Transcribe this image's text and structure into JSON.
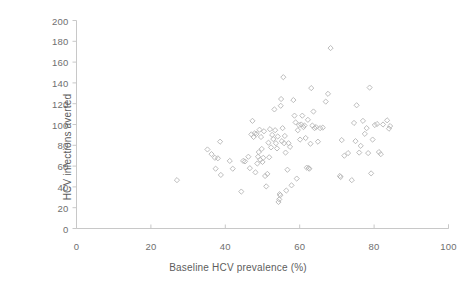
{
  "chart_data": {
    "type": "scatter",
    "title": "",
    "xlabel": "Baseline HCV prevalence (%)",
    "ylabel": "HCV infections averted",
    "xlim": [
      0,
      100
    ],
    "ylim": [
      0,
      200
    ],
    "xticks": [
      0,
      20,
      40,
      60,
      80,
      100
    ],
    "yticks": [
      0,
      20,
      40,
      60,
      80,
      100,
      120,
      140,
      160,
      180,
      200
    ],
    "grid": false,
    "legend": null,
    "marker": "open-diamond",
    "marker_color": "#b6b6b6",
    "axis_color": "#c8c8c8",
    "series": [
      {
        "name": "HCV infections averted vs baseline prevalence",
        "points": [
          [
            27.0,
            46.5
          ],
          [
            35.2,
            76.0
          ],
          [
            36.3,
            71.5
          ],
          [
            37.2,
            68.0
          ],
          [
            37.4,
            57.5
          ],
          [
            38.0,
            67.5
          ],
          [
            38.6,
            83.5
          ],
          [
            38.8,
            51.5
          ],
          [
            41.2,
            65.0
          ],
          [
            42.0,
            57.5
          ],
          [
            44.3,
            35.5
          ],
          [
            44.8,
            65.0
          ],
          [
            45.3,
            64.5
          ],
          [
            46.2,
            69.0
          ],
          [
            46.6,
            58.0
          ],
          [
            47.0,
            90.5
          ],
          [
            47.3,
            103.5
          ],
          [
            47.6,
            88.0
          ],
          [
            47.9,
            91.5
          ],
          [
            48.1,
            54.0
          ],
          [
            48.4,
            91.0
          ],
          [
            48.6,
            62.5
          ],
          [
            48.8,
            69.0
          ],
          [
            49.0,
            73.5
          ],
          [
            49.2,
            95.0
          ],
          [
            49.4,
            66.0
          ],
          [
            49.6,
            88.0
          ],
          [
            49.8,
            76.5
          ],
          [
            50.0,
            64.0
          ],
          [
            50.2,
            68.0
          ],
          [
            50.4,
            93.5
          ],
          [
            50.7,
            50.5
          ],
          [
            51.0,
            40.5
          ],
          [
            51.3,
            52.5
          ],
          [
            51.6,
            82.5
          ],
          [
            51.8,
            68.5
          ],
          [
            52.0,
            95.5
          ],
          [
            52.3,
            78.0
          ],
          [
            52.6,
            90.0
          ],
          [
            52.9,
            86.0
          ],
          [
            53.2,
            114.5
          ],
          [
            53.4,
            94.5
          ],
          [
            53.6,
            82.0
          ],
          [
            53.9,
            77.0
          ],
          [
            54.1,
            88.5
          ],
          [
            54.3,
            25.5
          ],
          [
            54.5,
            28.0
          ],
          [
            54.6,
            33.0
          ],
          [
            54.8,
            32.0
          ],
          [
            54.9,
            118.0
          ],
          [
            55.0,
            124.5
          ],
          [
            55.2,
            84.0
          ],
          [
            55.4,
            96.5
          ],
          [
            55.6,
            145.5
          ],
          [
            55.8,
            82.0
          ],
          [
            56.0,
            89.0
          ],
          [
            56.2,
            73.0
          ],
          [
            56.4,
            36.5
          ],
          [
            56.7,
            56.5
          ],
          [
            57.0,
            82.0
          ],
          [
            57.4,
            78.5
          ],
          [
            57.8,
            41.5
          ],
          [
            58.3,
            123.5
          ],
          [
            58.6,
            108.5
          ],
          [
            58.9,
            102.0
          ],
          [
            59.2,
            48.0
          ],
          [
            59.5,
            94.5
          ],
          [
            59.8,
            99.5
          ],
          [
            60.1,
            85.5
          ],
          [
            60.4,
            100.0
          ],
          [
            60.7,
            108.5
          ],
          [
            61.0,
            97.5
          ],
          [
            61.3,
            99.0
          ],
          [
            61.6,
            87.0
          ],
          [
            61.9,
            58.5
          ],
          [
            62.2,
            104.5
          ],
          [
            62.4,
            58.0
          ],
          [
            62.6,
            57.5
          ],
          [
            62.9,
            81.5
          ],
          [
            63.1,
            135.0
          ],
          [
            63.4,
            99.0
          ],
          [
            63.7,
            112.5
          ],
          [
            64.0,
            96.5
          ],
          [
            64.4,
            97.5
          ],
          [
            64.9,
            83.5
          ],
          [
            65.5,
            96.5
          ],
          [
            66.2,
            97.0
          ],
          [
            67.0,
            122.0
          ],
          [
            67.6,
            129.5
          ],
          [
            68.3,
            173.5
          ],
          [
            70.8,
            50.5
          ],
          [
            71.0,
            49.5
          ],
          [
            71.3,
            85.0
          ],
          [
            72.0,
            70.0
          ],
          [
            73.0,
            72.5
          ],
          [
            74.0,
            46.5
          ],
          [
            74.6,
            101.5
          ],
          [
            75.0,
            84.0
          ],
          [
            75.3,
            118.5
          ],
          [
            76.0,
            73.0
          ],
          [
            76.4,
            79.5
          ],
          [
            77.0,
            103.5
          ],
          [
            77.5,
            91.0
          ],
          [
            78.0,
            96.5
          ],
          [
            78.4,
            72.5
          ],
          [
            78.8,
            135.5
          ],
          [
            79.2,
            53.0
          ],
          [
            79.6,
            85.5
          ],
          [
            80.2,
            99.5
          ],
          [
            80.8,
            100.5
          ],
          [
            81.3,
            73.5
          ],
          [
            81.8,
            71.5
          ],
          [
            82.4,
            100.0
          ],
          [
            83.5,
            104.0
          ],
          [
            84.0,
            96.0
          ],
          [
            84.3,
            98.5
          ]
        ]
      }
    ]
  }
}
